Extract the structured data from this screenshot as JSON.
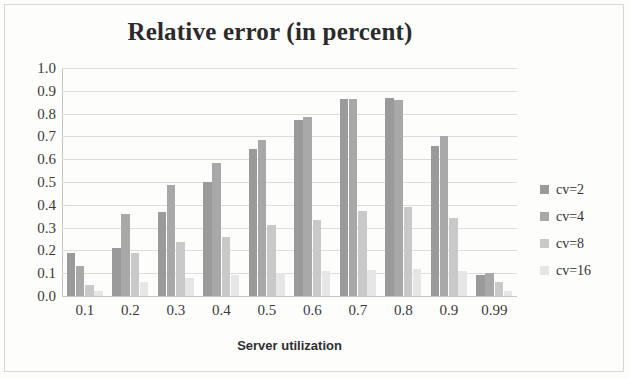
{
  "chart_data": {
    "type": "bar",
    "title": "Relative error (in percent)",
    "xlabel": "Server utilization",
    "ylabel": "",
    "categories": [
      "0.1",
      "0.2",
      "0.3",
      "0.4",
      "0.5",
      "0.6",
      "0.7",
      "0.8",
      "0.9",
      "0.99"
    ],
    "series": [
      {
        "name": "cv=2",
        "color": "#9a9a9a",
        "values": [
          0.19,
          0.21,
          0.37,
          0.5,
          0.645,
          0.77,
          0.865,
          0.87,
          0.66,
          0.09
        ]
      },
      {
        "name": "cv=4",
        "color": "#a8a8a8",
        "values": [
          0.13,
          0.36,
          0.485,
          0.585,
          0.685,
          0.785,
          0.865,
          0.86,
          0.7,
          0.1
        ]
      },
      {
        "name": "cv=8",
        "color": "#c9c9c9",
        "values": [
          0.05,
          0.19,
          0.235,
          0.26,
          0.31,
          0.335,
          0.375,
          0.39,
          0.34,
          0.06
        ]
      },
      {
        "name": "cv=16",
        "color": "#e6e6e6",
        "values": [
          0.02,
          0.06,
          0.08,
          0.09,
          0.1,
          0.11,
          0.115,
          0.12,
          0.11,
          0.02
        ]
      }
    ],
    "ylim": [
      0.0,
      1.0
    ],
    "ytick_labels": [
      "1.0",
      "0.9",
      "0.8",
      "0.7",
      "0.6",
      "0.5",
      "0.4",
      "0.3",
      "0.2",
      "0.1",
      "0.0"
    ],
    "ytick_values": [
      1.0,
      0.9,
      0.8,
      0.7,
      0.6,
      0.5,
      0.4,
      0.3,
      0.2,
      0.1,
      0.0
    ],
    "grid": true,
    "legend_position": "right"
  },
  "legend": {
    "entries": [
      {
        "label": "cv=2"
      },
      {
        "label": "cv=4"
      },
      {
        "label": "cv=8"
      },
      {
        "label": "cv=16"
      }
    ]
  }
}
